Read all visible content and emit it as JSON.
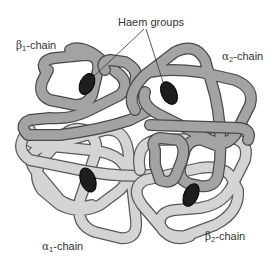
{
  "diagram": {
    "labels": {
      "haem_groups": "Haem groups",
      "beta1": {
        "symbol": "β",
        "subscript": "1",
        "suffix": "-chain"
      },
      "alpha2": {
        "symbol": "α",
        "subscript": "2",
        "suffix": "-chain"
      },
      "alpha1": {
        "symbol": "α",
        "subscript": "1",
        "suffix": "-chain"
      },
      "beta2": {
        "symbol": "β",
        "subscript": "2",
        "suffix": "-chain"
      }
    },
    "colors": {
      "dark_chain_fill": "#a3a3a3",
      "light_chain_fill": "#d4d4d4",
      "chain_outline": "#4a4a4a",
      "haem_fill": "#1e1e1e",
      "background": "#ffffff",
      "text": "#333333"
    },
    "components": [
      {
        "name": "beta1-chain",
        "shade": "dark"
      },
      {
        "name": "alpha2-chain",
        "shade": "dark"
      },
      {
        "name": "alpha1-chain",
        "shade": "light"
      },
      {
        "name": "beta2-chain",
        "shade": "light"
      },
      {
        "name": "haem-group",
        "count": 4
      }
    ]
  }
}
